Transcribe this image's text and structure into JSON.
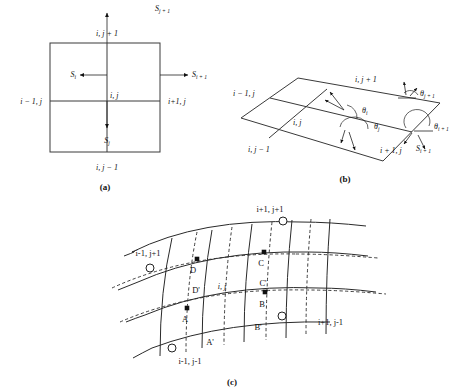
{
  "figure": {
    "background_color": "#ffffff",
    "line_color": "#2a2a2a",
    "text_color": "#111111"
  },
  "panel_a": {
    "tag": "(a)",
    "labels": {
      "top": "i, j + 1",
      "bottom": "i, j − 1",
      "left": "i − 1, j",
      "right": "i+1, j",
      "center": "i, j"
    },
    "flux_arrows": [
      {
        "name": "S_j_plus_1",
        "base": "S",
        "sub": "j + 1",
        "direction": "up"
      },
      {
        "name": "S_i_plus_1",
        "base": "S",
        "sub": "i + 1",
        "direction": "right"
      },
      {
        "name": "S_i",
        "base": "S",
        "sub": "i",
        "direction": "left"
      },
      {
        "name": "S_j",
        "base": "S",
        "sub": "j",
        "direction": "down"
      }
    ]
  },
  "panel_b": {
    "tag": "(b)",
    "labels": {
      "top": "i, j + 1",
      "left": "i − 1, j",
      "bottom_left": "i, j − 1",
      "center": "i, j",
      "bottom_right": "i + 1, j"
    },
    "angles": [
      {
        "name": "theta_i",
        "base": "θ",
        "sub": "i"
      },
      {
        "name": "theta_j",
        "base": "θ",
        "sub": "j"
      },
      {
        "name": "theta_j_plus_1",
        "base": "θ",
        "sub": "j + 1"
      },
      {
        "name": "theta_i_plus_1",
        "base": "θ",
        "sub": "i + 1"
      }
    ],
    "flux_arrows": [
      {
        "name": "S_i_plus_1",
        "base": "S",
        "sub": "i + 1"
      }
    ]
  },
  "panel_c": {
    "tag": "(c)",
    "corner_labels": {
      "top_right": "i+1, j+1",
      "top_left": "i-1, j+1",
      "bottom_left": "i-1, j-1",
      "bottom_right": "i+1, j-1"
    },
    "center_label": "i, j",
    "points": [
      {
        "name": "point-A",
        "label": "A"
      },
      {
        "name": "point-B",
        "label": "B"
      },
      {
        "name": "point-C",
        "label": "C"
      },
      {
        "name": "point-D",
        "label": "D"
      },
      {
        "name": "point-A-prime",
        "label": "A'"
      },
      {
        "name": "point-B-prime",
        "label": "B'"
      },
      {
        "name": "point-C-prime",
        "label": "C'"
      },
      {
        "name": "point-D-prime",
        "label": "D'"
      }
    ]
  }
}
